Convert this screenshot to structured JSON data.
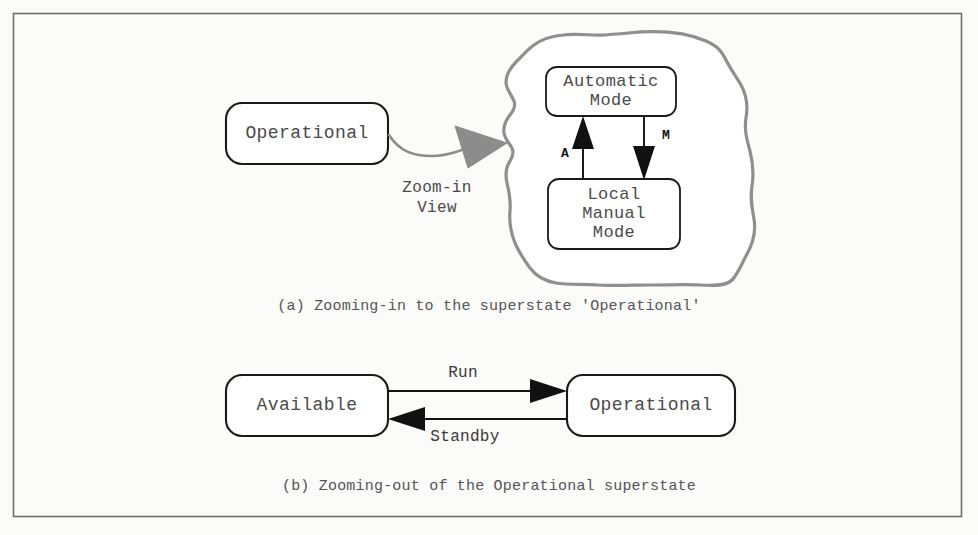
{
  "figure": {
    "background_color": "#fbfbf9",
    "border_color": "#6e6e6e",
    "panels": [
      {
        "id": "a",
        "caption": "(a) Zooming-in to the superstate 'Operational'"
      },
      {
        "id": "b",
        "caption": "(b) Zooming-out of the Operational superstate"
      }
    ]
  },
  "panel_a": {
    "superstate_box": {
      "label": "Operational"
    },
    "zoom_arrow": {
      "label_line1": "Zoom-in",
      "label_line2": "View",
      "color": "#8c8c8c"
    },
    "blob": {
      "name": "superstate-blob",
      "color": "#8f8f8f"
    },
    "states": [
      {
        "id": "automatic-mode",
        "label_line1": "Automatic",
        "label_line2": "Mode"
      },
      {
        "id": "local-manual-mode",
        "label_line1": "Local",
        "label_line2": "Manual",
        "label_line3": "Mode"
      }
    ],
    "transitions": [
      {
        "id": "to-automatic",
        "label": "A",
        "from": "local-manual-mode",
        "to": "automatic-mode",
        "direction": "up"
      },
      {
        "id": "to-manual",
        "label": "M",
        "from": "automatic-mode",
        "to": "local-manual-mode",
        "direction": "down"
      }
    ]
  },
  "panel_b": {
    "states": [
      {
        "id": "available",
        "label": "Available"
      },
      {
        "id": "operational",
        "label": "Operational"
      }
    ],
    "transitions": [
      {
        "id": "run",
        "label": "Run",
        "from": "available",
        "to": "operational",
        "direction": "right"
      },
      {
        "id": "standby",
        "label": "Standby",
        "from": "operational",
        "to": "available",
        "direction": "left"
      }
    ]
  }
}
